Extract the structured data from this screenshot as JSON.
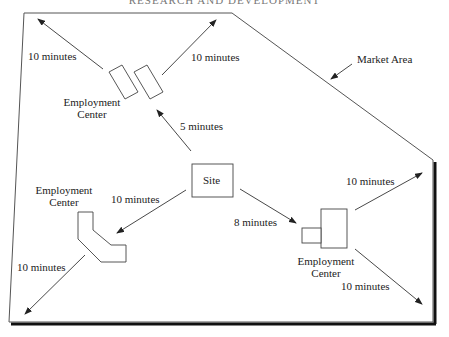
{
  "header": {
    "text": "RESEARCH AND DEVELOPMENT"
  },
  "diagram": {
    "market_area_label": "Market Area",
    "site_label": "Site",
    "employment_centers": [
      {
        "id": "top",
        "label_line1": "Employment",
        "label_line2": "Center"
      },
      {
        "id": "left",
        "label_line1": "Employment",
        "label_line2": "Center"
      },
      {
        "id": "right",
        "label_line1": "Employment",
        "label_line2": "Center"
      }
    ],
    "travel_times": {
      "site_to_top_center": "5 minutes",
      "site_to_left_center": "10 minutes",
      "site_to_right_center": "8 minutes",
      "top_center_upper_left": "10 minutes",
      "top_center_upper_right": "10 minutes",
      "left_center_lower_left": "10 minutes",
      "right_center_upper_right": "10 minutes",
      "right_center_lower_right": "10 minutes"
    },
    "colors": {
      "stroke": "#333333",
      "shadow": "#111111",
      "background": "#ffffff"
    }
  }
}
